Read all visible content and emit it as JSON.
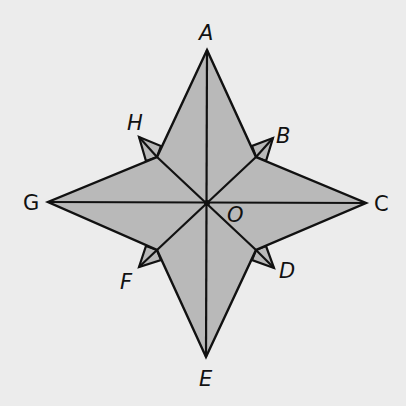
{
  "diagram": {
    "type": "compass-rose",
    "fill_color": "#b9b9b9",
    "stroke_color": "#111111",
    "background": "#ececec",
    "labels": {
      "A": "A",
      "B": "B",
      "C": "C",
      "D": "D",
      "E": "E",
      "F": "F",
      "G": "G",
      "H": "H",
      "O": "O"
    }
  }
}
